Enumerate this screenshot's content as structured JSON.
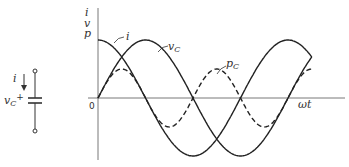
{
  "circuit": {
    "current_label": "i",
    "voltage_label": "v",
    "voltage_sub": "C",
    "plus_sign": "+"
  },
  "chart_data": {
    "type": "line",
    "title": "",
    "ylabel_lines": [
      "i",
      "v",
      "p"
    ],
    "xlabel": "ωt",
    "origin_label": "0",
    "series": [
      {
        "name": "i",
        "label": "i",
        "function": "cos(ωt)",
        "amplitude": 1.0,
        "style": "solid"
      },
      {
        "name": "v_C",
        "label": "v",
        "label_sub": "C",
        "function": "sin(ωt)",
        "amplitude": 1.0,
        "style": "solid"
      },
      {
        "name": "p_C",
        "label": "p",
        "label_sub": "C",
        "function": "0.5·sin(2ωt)",
        "amplitude": 0.5,
        "style": "dashed"
      }
    ],
    "x_range_periods": [
      0,
      1.125
    ],
    "colors": {
      "line": "#222222",
      "axis": "#555555"
    }
  }
}
